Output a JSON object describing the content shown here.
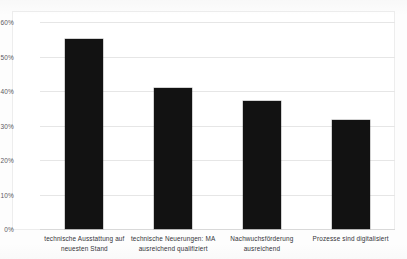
{
  "chart_data": {
    "type": "bar",
    "title": "",
    "xlabel": "",
    "ylabel": "",
    "categories": [
      "technische Ausstattung auf neuesten Stand",
      "technische Neuerungen: MA ausreichend qualifiziert",
      "Nachwuchsförderung ausreichend",
      "Prozesse sind digitalisiert"
    ],
    "values": [
      55,
      41,
      37,
      31.5
    ],
    "value_labels": [
      "55%",
      "41%",
      "37%",
      "31.5%"
    ],
    "ylim": [
      0,
      60
    ],
    "ytick_values": [
      0,
      10,
      20,
      30,
      40,
      50,
      60
    ],
    "ytick_labels": [
      "0%",
      "10%",
      "20%",
      "30%",
      "40%",
      "50%",
      "60%"
    ],
    "grid": true,
    "grid_axis": "y",
    "legend": false,
    "legend_position": "none",
    "bar_color": "#121212",
    "grid_color": "#e6e6e6",
    "background_color": "#ffffff",
    "annotations": []
  },
  "figure": {
    "cropped_title_ghost": "",
    "plot_border_color": "#ededed"
  }
}
